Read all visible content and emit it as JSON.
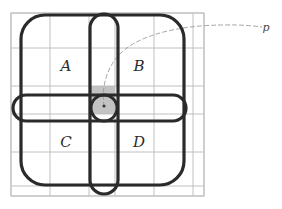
{
  "figure": {
    "title": "",
    "background_color": "#ffffff",
    "width": 282,
    "height": 209,
    "colors": {
      "grid_line": "#b9b9b9",
      "grid_border": "#c2c2c2",
      "heavy_curve": "#2a2a2a",
      "shaded_cell": "#b8b8b8",
      "dashed_curve": "#9a9a9a",
      "label_text": "#2b2b2b",
      "point_marker": "#3a3a3a"
    },
    "grid": {
      "left": 11,
      "top": 13,
      "right": 204,
      "bottom": 196,
      "x_lines": [
        11,
        50,
        89,
        115,
        154,
        193,
        204
      ],
      "y_lines": [
        13,
        48,
        86,
        114,
        152,
        186,
        196
      ],
      "stroke_width": 0.9
    },
    "labels": {
      "region_a": "A",
      "region_b": "B",
      "region_c": "C",
      "region_d": "D",
      "curve_p": "p"
    },
    "label_positions": {
      "region_a": {
        "x": 66,
        "y": 71
      },
      "region_b": {
        "x": 139,
        "y": 71
      },
      "region_c": {
        "x": 66,
        "y": 147
      },
      "region_d": {
        "x": 139,
        "y": 147
      },
      "curve_p": {
        "x": 266,
        "y": 31
      }
    },
    "shapes": {
      "outer_rounded_square": {
        "name": "outer-rounded-square",
        "x": 21,
        "y": 15,
        "width": 163,
        "height": 170,
        "radius": 24,
        "stroke_width": 3.2
      },
      "vertical_stadium": {
        "name": "vertical-stadium",
        "x": 90,
        "y": 14,
        "width": 28,
        "height": 180,
        "radius": 14,
        "stroke_width": 3.2
      },
      "horizontal_stadium": {
        "name": "horizontal-stadium",
        "x": 13,
        "y": 95,
        "width": 173,
        "height": 26,
        "radius": 13,
        "stroke_width": 3.2
      },
      "center_circle": {
        "name": "center-circle",
        "cx": 104,
        "cy": 108,
        "r": 13,
        "stroke_width": 3.0
      },
      "shaded_cell": {
        "name": "shaded-center-cell",
        "x": 89,
        "y": 86,
        "width": 26,
        "height": 28
      },
      "point_marker": {
        "name": "center-point-marker",
        "cx": 104,
        "cy": 106,
        "r": 1.6
      }
    },
    "dashed_curve": {
      "name": "dashed-curve-p",
      "path": "M 104 106 C 102 92 104 72 118 56 C 134 38 166 29 200 26 C 228 24 248 25 262 27",
      "stroke_width": 0.9,
      "dash_pattern": "4 3"
    }
  }
}
